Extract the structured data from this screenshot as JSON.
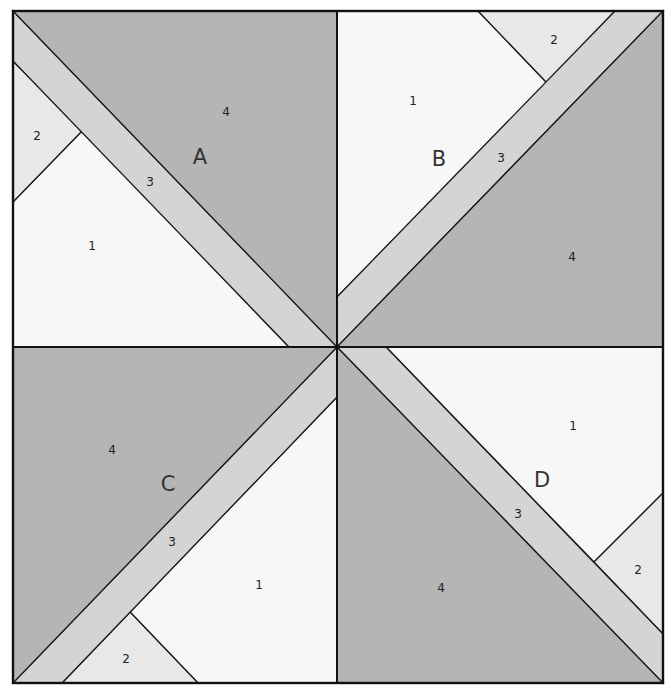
{
  "diagram": {
    "outer": {
      "x1": 13,
      "y1": 11,
      "x2": 663,
      "y2": 683
    },
    "center": {
      "x": 337,
      "y": 347
    },
    "colors": {
      "piece_1": "#f7f7f7",
      "piece_2": "#e8e8e8",
      "piece_3": "#d4d4d4",
      "piece_4": "#b5b5b5",
      "line": "#111111"
    },
    "blocks": [
      {
        "id": "A",
        "label": "A",
        "label_pos": [
          200,
          158
        ],
        "pieces": [
          {
            "num": "1",
            "fill": "piece_1",
            "points": [
              [
                13,
                202
              ],
              [
                82,
                131
              ],
              [
                289,
                347
              ],
              [
                13,
                347
              ]
            ],
            "label_pos": [
              92,
              246
            ]
          },
          {
            "num": "2",
            "fill": "piece_2",
            "points": [
              [
                13,
                61
              ],
              [
                82,
                131
              ],
              [
                13,
                202
              ]
            ],
            "label_pos": [
              37,
              136
            ]
          },
          {
            "num": "3",
            "fill": "piece_3",
            "points": [
              [
                13,
                11
              ],
              [
                337,
                347
              ],
              [
                289,
                347
              ],
              [
                13,
                61
              ]
            ],
            "label_pos": [
              150,
              182
            ]
          },
          {
            "num": "4",
            "fill": "piece_4",
            "points": [
              [
                13,
                11
              ],
              [
                337,
                11
              ],
              [
                337,
                347
              ]
            ],
            "label_pos": [
              226,
              112
            ]
          }
        ]
      },
      {
        "id": "B",
        "label": "B",
        "label_pos": [
          439,
          160
        ],
        "pieces": [
          {
            "num": "1",
            "fill": "piece_1",
            "points": [
              [
                337,
                11
              ],
              [
                478,
                11
              ],
              [
                547,
                83
              ],
              [
                337,
                297
              ]
            ],
            "label_pos": [
              413,
              101
            ]
          },
          {
            "num": "2",
            "fill": "piece_2",
            "points": [
              [
                478,
                11
              ],
              [
                615,
                11
              ],
              [
                547,
                83
              ]
            ],
            "label_pos": [
              554,
              40
            ]
          },
          {
            "num": "3",
            "fill": "piece_3",
            "points": [
              [
                615,
                11
              ],
              [
                663,
                11
              ],
              [
                337,
                347
              ],
              [
                337,
                297
              ]
            ],
            "label_pos": [
              501,
              158
            ]
          },
          {
            "num": "4",
            "fill": "piece_4",
            "points": [
              [
                663,
                11
              ],
              [
                663,
                347
              ],
              [
                337,
                347
              ]
            ],
            "label_pos": [
              572,
              257
            ]
          }
        ]
      },
      {
        "id": "C",
        "label": "C",
        "label_pos": [
          168,
          485
        ],
        "pieces": [
          {
            "num": "1",
            "fill": "piece_1",
            "points": [
              [
                337,
                397
              ],
              [
                337,
                683
              ],
              [
                198,
                683
              ],
              [
                130,
                612
              ]
            ],
            "label_pos": [
              259,
              585
            ]
          },
          {
            "num": "2",
            "fill": "piece_2",
            "points": [
              [
                62,
                683
              ],
              [
                130,
                612
              ],
              [
                198,
                683
              ]
            ],
            "label_pos": [
              126,
              659
            ]
          },
          {
            "num": "3",
            "fill": "piece_3",
            "points": [
              [
                337,
                347
              ],
              [
                337,
                397
              ],
              [
                62,
                683
              ],
              [
                13,
                683
              ]
            ],
            "label_pos": [
              172,
              542
            ]
          },
          {
            "num": "4",
            "fill": "piece_4",
            "points": [
              [
                13,
                347
              ],
              [
                337,
                347
              ],
              [
                13,
                683
              ]
            ],
            "label_pos": [
              112,
              450
            ]
          }
        ]
      },
      {
        "id": "D",
        "label": "D",
        "label_pos": [
          542,
          481
        ],
        "pieces": [
          {
            "num": "1",
            "fill": "piece_1",
            "points": [
              [
                386,
                347
              ],
              [
                663,
                347
              ],
              [
                663,
                493
              ],
              [
                594,
                562
              ]
            ],
            "label_pos": [
              573,
              426
            ]
          },
          {
            "num": "2",
            "fill": "piece_2",
            "points": [
              [
                663,
                493
              ],
              [
                663,
                634
              ],
              [
                594,
                562
              ]
            ],
            "label_pos": [
              638,
              570
            ]
          },
          {
            "num": "3",
            "fill": "piece_3",
            "points": [
              [
                337,
                347
              ],
              [
                386,
                347
              ],
              [
                663,
                634
              ],
              [
                663,
                683
              ]
            ],
            "label_pos": [
              518,
              514
            ]
          },
          {
            "num": "4",
            "fill": "piece_4",
            "points": [
              [
                337,
                347
              ],
              [
                663,
                683
              ],
              [
                337,
                683
              ]
            ],
            "label_pos": [
              441,
              588
            ]
          }
        ]
      }
    ]
  }
}
